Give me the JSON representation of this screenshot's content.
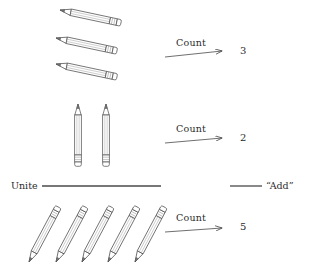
{
  "figure": {
    "stroke_color": "#4a4a4a",
    "text_color": "#2b2b2b",
    "background_color": "#ffffff"
  },
  "groups": [
    {
      "id": "group-top",
      "pencil_count": 3,
      "orientation": "diagonal-shallow",
      "operation_label": "Count",
      "result": "3"
    },
    {
      "id": "group-middle",
      "pencil_count": 2,
      "orientation": "vertical",
      "operation_label": "Count",
      "result": "2"
    },
    {
      "id": "group-bottom",
      "pencil_count": 5,
      "orientation": "diagonal-steep",
      "operation_label": "Count",
      "result": "5"
    }
  ],
  "unite": {
    "label": "Unite"
  },
  "add": {
    "label": "“Add”"
  }
}
